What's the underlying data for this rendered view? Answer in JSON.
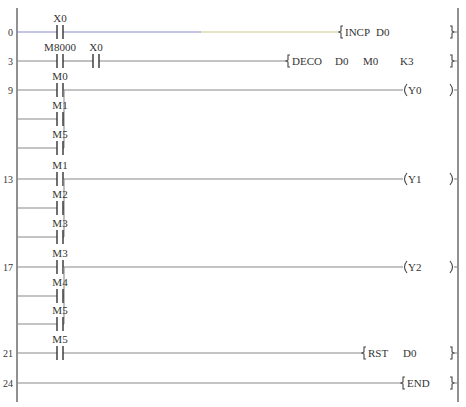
{
  "diagram": {
    "type": "ladder-logic",
    "rails": {
      "left_x": 17,
      "right_x": 458,
      "top_y": 8,
      "bottom_y": 402
    },
    "wire_colors": {
      "default": "#8a8a8a",
      "rung0_left": "#8888cc",
      "rung0_right": "#cccc88"
    },
    "rungs": [
      {
        "step": "0",
        "y": 32,
        "contacts": [
          {
            "label": "X0",
            "x": 60
          }
        ],
        "branches": [],
        "output": {
          "kind": "instruction",
          "open_x": 339,
          "texts": [
            {
              "t": "INCP",
              "x": 345
            },
            {
              "t": "D0",
              "x": 376
            }
          ]
        }
      },
      {
        "step": "3",
        "y": 61,
        "contacts": [
          {
            "label": "M8000",
            "x": 60
          },
          {
            "label": "X0",
            "x": 96
          }
        ],
        "branches": [],
        "output": {
          "kind": "instruction",
          "open_x": 286,
          "texts": [
            {
              "t": "DECO",
              "x": 292
            },
            {
              "t": "D0",
              "x": 335
            },
            {
              "t": "M0",
              "x": 363
            },
            {
              "t": "K3",
              "x": 400
            }
          ]
        }
      },
      {
        "step": "9",
        "y": 90,
        "contacts": [
          {
            "label": "M0",
            "x": 60
          }
        ],
        "branches": [
          {
            "label": "M1",
            "y": 119
          },
          {
            "label": "M5",
            "y": 148
          }
        ],
        "output": {
          "kind": "coil",
          "open_x": 403,
          "texts": [
            {
              "t": "Y0",
              "x": 408
            }
          ]
        }
      },
      {
        "step": "13",
        "y": 179,
        "contacts": [
          {
            "label": "M1",
            "x": 60
          }
        ],
        "branches": [
          {
            "label": "M2",
            "y": 208
          },
          {
            "label": "M3",
            "y": 237
          }
        ],
        "output": {
          "kind": "coil",
          "open_x": 403,
          "texts": [
            {
              "t": "Y1",
              "x": 408
            }
          ]
        }
      },
      {
        "step": "17",
        "y": 267,
        "contacts": [
          {
            "label": "M3",
            "x": 60
          }
        ],
        "branches": [
          {
            "label": "M4",
            "y": 296
          },
          {
            "label": "M5",
            "y": 324
          }
        ],
        "output": {
          "kind": "coil",
          "open_x": 403,
          "texts": [
            {
              "t": "Y2",
              "x": 408
            }
          ]
        }
      },
      {
        "step": "21",
        "y": 353,
        "contacts": [
          {
            "label": "M5",
            "x": 60
          }
        ],
        "branches": [],
        "output": {
          "kind": "instruction",
          "open_x": 362,
          "texts": [
            {
              "t": "RST",
              "x": 368
            },
            {
              "t": "D0",
              "x": 403
            }
          ]
        }
      },
      {
        "step": "24",
        "y": 383,
        "contacts": [],
        "branches": [],
        "output": {
          "kind": "instruction",
          "open_x": 401,
          "texts": [
            {
              "t": "END",
              "x": 407
            }
          ]
        }
      }
    ]
  }
}
